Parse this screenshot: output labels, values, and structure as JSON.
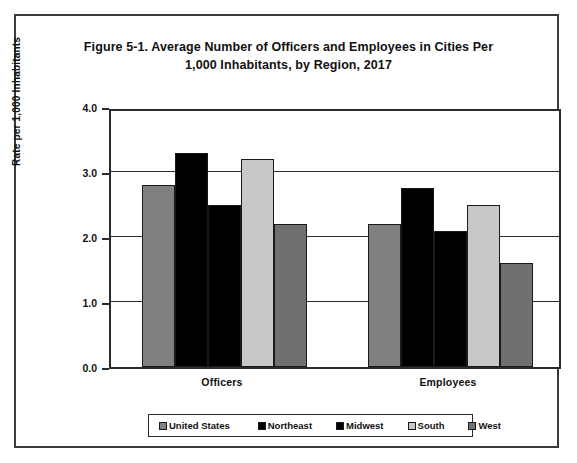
{
  "chart_data": {
    "type": "bar",
    "title": "Figure 5-1. Average Number of Officers and Employees in Cities Per 1,000 Inhabitants, by Region, 2017",
    "title_line1": "Figure 5-1. Average Number of Officers and Employees in Cities Per",
    "title_line2": "1,000 Inhabitants, by Region, 2017",
    "xlabel": "",
    "ylabel": "Rate per 1,000 Inhabitants",
    "categories": [
      "Officers",
      "Employees"
    ],
    "ylim": [
      0.0,
      4.0
    ],
    "ytick_values": [
      0.0,
      1.0,
      2.0,
      3.0,
      4.0
    ],
    "ytick_labels": [
      "0.0",
      "1.0",
      "2.0",
      "3.0",
      "4.0"
    ],
    "grid": true,
    "legend_position": "bottom",
    "series": [
      {
        "name": "United States",
        "color": "#808080",
        "values": [
          2.8,
          2.2
        ]
      },
      {
        "name": "Northeast",
        "color": "#000000",
        "values": [
          3.3,
          2.75
        ]
      },
      {
        "name": "Midwest",
        "color": "#000000",
        "values": [
          2.5,
          2.1
        ]
      },
      {
        "name": "South",
        "color": "#c8c8c8",
        "values": [
          3.2,
          2.5
        ]
      },
      {
        "name": "West",
        "color": "#707070",
        "values": [
          2.2,
          1.6
        ]
      }
    ]
  }
}
